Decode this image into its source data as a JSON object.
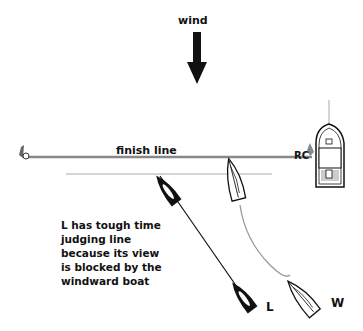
{
  "diagram": {
    "wind_label": "wind",
    "finish_line_label": "finish line",
    "note": "L has tough time judging line because its view is blocked by the windward boat",
    "boat_leeward_label": "L",
    "boat_windward_label": "W",
    "committee_boat_label": "RC",
    "colors": {
      "line": "#888888",
      "boat_l_fill": "#111111",
      "boat_w_fill": "#ffffff",
      "track_w": "#999999",
      "track_l": "#111111"
    }
  }
}
